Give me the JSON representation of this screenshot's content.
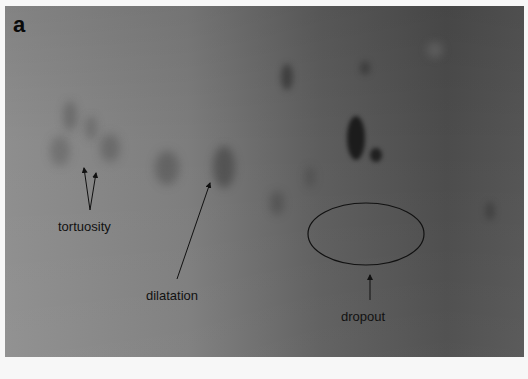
{
  "figure": {
    "panel_label": "a",
    "background_color": "#6e6e6e",
    "annotations": [
      {
        "label": "tortuosity",
        "x": 58,
        "y": 219
      },
      {
        "label": "dilatation",
        "x": 146,
        "y": 288
      },
      {
        "label": "dropout",
        "x": 341,
        "y": 309
      }
    ],
    "dropout_ellipse": {
      "cx": 366,
      "cy": 234,
      "rx": 58,
      "ry": 31
    }
  }
}
